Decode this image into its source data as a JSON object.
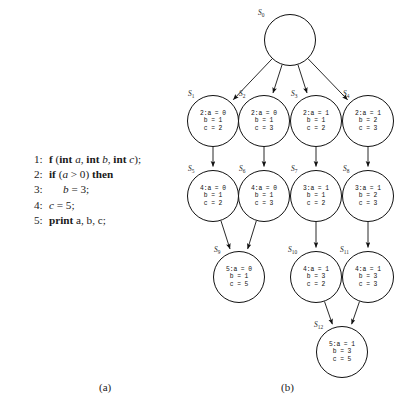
{
  "figure": {
    "captions": {
      "a": "(a)",
      "b": "(b)"
    }
  },
  "code_listing": {
    "lines": [
      {
        "no": "1:",
        "indent": false,
        "tokens": [
          {
            "t": "f",
            "s": "kw"
          },
          {
            "t": " (",
            "s": "plain"
          },
          {
            "t": "int",
            "s": "kw"
          },
          {
            "t": " ",
            "s": "plain"
          },
          {
            "t": "a",
            "s": "var"
          },
          {
            "t": ", ",
            "s": "plain"
          },
          {
            "t": "int",
            "s": "kw"
          },
          {
            "t": " ",
            "s": "plain"
          },
          {
            "t": "b",
            "s": "var"
          },
          {
            "t": ", ",
            "s": "plain"
          },
          {
            "t": "int",
            "s": "kw"
          },
          {
            "t": " ",
            "s": "plain"
          },
          {
            "t": "c",
            "s": "var"
          },
          {
            "t": ");",
            "s": "plain"
          }
        ]
      },
      {
        "no": "2:",
        "indent": false,
        "tokens": [
          {
            "t": "if",
            "s": "kw"
          },
          {
            "t": " (",
            "s": "plain"
          },
          {
            "t": "a",
            "s": "var"
          },
          {
            "t": " > 0",
            "s": "plain"
          },
          {
            "t": ") ",
            "s": "plain"
          },
          {
            "t": "then",
            "s": "kw"
          }
        ]
      },
      {
        "no": "3:",
        "indent": true,
        "tokens": [
          {
            "t": "b",
            "s": "var"
          },
          {
            "t": " = 3;",
            "s": "plain"
          }
        ]
      },
      {
        "no": "4:",
        "indent": false,
        "tokens": [
          {
            "t": "c",
            "s": "var"
          },
          {
            "t": " = 5;",
            "s": "plain"
          }
        ]
      },
      {
        "no": "5:",
        "indent": false,
        "tokens": [
          {
            "t": "print",
            "s": "kw"
          },
          {
            "t": " a, b, c;",
            "s": "plain"
          }
        ]
      }
    ]
  },
  "graph": {
    "nodes": [
      {
        "id": "S0",
        "label": "S",
        "sub": "0",
        "cx": 104,
        "cy": 40,
        "r": 26,
        "line": "",
        "a": "",
        "b": "",
        "c": "",
        "empty": true,
        "name_x": 72,
        "name_y": 8
      },
      {
        "id": "S1",
        "label": "S",
        "sub": "1",
        "cx": 27,
        "cy": 121,
        "r": 26,
        "line": "2:",
        "a": "a = 0",
        "b": "b = 1",
        "c": "c = 2",
        "empty": false,
        "name_x": 2,
        "name_y": 89
      },
      {
        "id": "S2",
        "label": "S",
        "sub": "2",
        "cx": 78,
        "cy": 121,
        "r": 26,
        "line": "2:",
        "a": "a = 0",
        "b": "b = 1",
        "c": "c = 3",
        "empty": false,
        "name_x": 53,
        "name_y": 89
      },
      {
        "id": "S3",
        "label": "S",
        "sub": "3",
        "cx": 130,
        "cy": 121,
        "r": 26,
        "line": "2:",
        "a": "a = 1",
        "b": "b = 1",
        "c": "c = 2",
        "empty": false,
        "name_x": 105,
        "name_y": 89
      },
      {
        "id": "S4",
        "label": "S",
        "sub": "4",
        "cx": 182,
        "cy": 121,
        "r": 26,
        "line": "2:",
        "a": "a = 1",
        "b": "b = 2",
        "c": "c = 3",
        "empty": false,
        "name_x": 157,
        "name_y": 89
      },
      {
        "id": "S5",
        "label": "S",
        "sub": "5",
        "cx": 27,
        "cy": 196,
        "r": 26,
        "line": "4:",
        "a": "a = 0",
        "b": "b = 1",
        "c": "c = 2",
        "empty": false,
        "name_x": 2,
        "name_y": 164
      },
      {
        "id": "S6",
        "label": "S",
        "sub": "6",
        "cx": 78,
        "cy": 196,
        "r": 26,
        "line": "4:",
        "a": "a = 0",
        "b": "b = 1",
        "c": "c = 3",
        "empty": false,
        "name_x": 53,
        "name_y": 164
      },
      {
        "id": "S7",
        "label": "S",
        "sub": "7",
        "cx": 130,
        "cy": 196,
        "r": 26,
        "line": "3:",
        "a": "a = 1",
        "b": "b = 1",
        "c": "c = 2",
        "empty": false,
        "name_x": 105,
        "name_y": 164
      },
      {
        "id": "S8",
        "label": "S",
        "sub": "8",
        "cx": 182,
        "cy": 196,
        "r": 26,
        "line": "3:",
        "a": "a = 1",
        "b": "b = 2",
        "c": "c = 3",
        "empty": false,
        "name_x": 157,
        "name_y": 164
      },
      {
        "id": "S9",
        "label": "S",
        "sub": "9",
        "cx": 53,
        "cy": 277,
        "r": 26,
        "line": "5:",
        "a": "a = 0",
        "b": "b = 1",
        "c": "c = 5",
        "empty": false,
        "name_x": 28,
        "name_y": 245
      },
      {
        "id": "S10",
        "label": "S",
        "sub": "10",
        "cx": 130,
        "cy": 277,
        "r": 26,
        "line": "4:",
        "a": "a = 1",
        "b": "b = 3",
        "c": "c = 2",
        "empty": false,
        "name_x": 102,
        "name_y": 245
      },
      {
        "id": "S11",
        "label": "S",
        "sub": "11",
        "cx": 182,
        "cy": 277,
        "r": 26,
        "line": "4:",
        "a": "a = 1",
        "b": "b = 3",
        "c": "c = 3",
        "empty": false,
        "name_x": 154,
        "name_y": 245
      },
      {
        "id": "S12",
        "label": "S",
        "sub": "12",
        "cx": 156,
        "cy": 352,
        "r": 26,
        "line": "5:",
        "a": "a = 1",
        "b": "b = 3",
        "c": "c = 5",
        "empty": false,
        "name_x": 128,
        "name_y": 320
      }
    ],
    "edges": [
      {
        "from": "S0",
        "to": "S1"
      },
      {
        "from": "S0",
        "to": "S2"
      },
      {
        "from": "S0",
        "to": "S3"
      },
      {
        "from": "S0",
        "to": "S4"
      },
      {
        "from": "S1",
        "to": "S5"
      },
      {
        "from": "S2",
        "to": "S6"
      },
      {
        "from": "S3",
        "to": "S7"
      },
      {
        "from": "S4",
        "to": "S8"
      },
      {
        "from": "S5",
        "to": "S9"
      },
      {
        "from": "S6",
        "to": "S9"
      },
      {
        "from": "S7",
        "to": "S10"
      },
      {
        "from": "S8",
        "to": "S11"
      },
      {
        "from": "S10",
        "to": "S12"
      },
      {
        "from": "S11",
        "to": "S12"
      }
    ],
    "colors": {
      "stroke": "#111111",
      "node_fill": "#ffffff"
    }
  }
}
